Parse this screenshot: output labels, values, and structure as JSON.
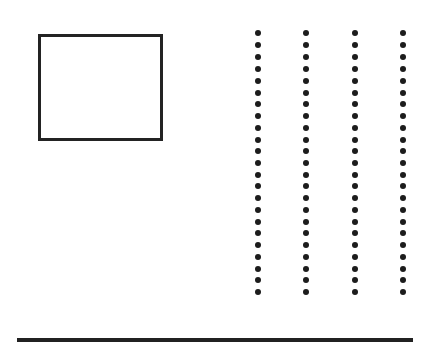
{
  "figure": {
    "title": "",
    "background_color": "#ffffff",
    "width": 430,
    "height": 356,
    "ink_color": "#232323"
  },
  "shapes": {
    "rectangle": {
      "name": "outline-rectangle",
      "label": "",
      "x": 38,
      "y": 34,
      "width": 125,
      "height": 107,
      "border_width": 3,
      "border_color": "#232323",
      "fill": "none"
    },
    "bottom_rule": {
      "name": "bottom-rule",
      "label": "",
      "x": 17,
      "y": 338,
      "width": 396,
      "height": 4,
      "color": "#212121"
    }
  },
  "chart_data": {
    "type": "scatter",
    "title": "",
    "subtitle": "",
    "xlabel": "",
    "ylabel": "",
    "grid": false,
    "legend_position": "none",
    "xlim": [
      0,
      430
    ],
    "ylim": [
      0,
      356
    ],
    "tick_labels_x": [],
    "tick_labels_y": [],
    "annotations": [],
    "marker": {
      "shape": "circle",
      "diameter_px": 6,
      "color": "#1c1c1c"
    },
    "dot_columns_count": 4,
    "dots_per_column": 23,
    "column_x": [
      258,
      306,
      355,
      403
    ],
    "row_y": [
      33,
      45,
      57,
      69,
      81,
      93,
      104,
      116,
      128,
      140,
      151,
      163,
      175,
      186,
      198,
      210,
      222,
      233,
      245,
      257,
      269,
      280,
      292
    ],
    "series": [
      {
        "name": "column-1",
        "x": [
          258,
          258,
          258,
          258,
          258,
          258,
          258,
          258,
          258,
          258,
          258,
          258,
          258,
          258,
          258,
          258,
          258,
          258,
          258,
          258,
          258,
          258,
          258
        ],
        "y": [
          33,
          45,
          57,
          69,
          81,
          93,
          104,
          116,
          128,
          140,
          151,
          163,
          175,
          186,
          198,
          210,
          222,
          233,
          245,
          257,
          269,
          280,
          292
        ]
      },
      {
        "name": "column-2",
        "x": [
          306,
          306,
          306,
          306,
          306,
          306,
          306,
          306,
          306,
          306,
          306,
          306,
          306,
          306,
          306,
          306,
          306,
          306,
          306,
          306,
          306,
          306,
          306
        ],
        "y": [
          33,
          45,
          57,
          69,
          81,
          93,
          104,
          116,
          128,
          140,
          151,
          163,
          175,
          186,
          198,
          210,
          222,
          233,
          245,
          257,
          269,
          280,
          292
        ]
      },
      {
        "name": "column-3",
        "x": [
          355,
          355,
          355,
          355,
          355,
          355,
          355,
          355,
          355,
          355,
          355,
          355,
          355,
          355,
          355,
          355,
          355,
          355,
          355,
          355,
          355,
          355,
          355
        ],
        "y": [
          33,
          45,
          57,
          69,
          81,
          93,
          104,
          116,
          128,
          140,
          151,
          163,
          175,
          186,
          198,
          210,
          222,
          233,
          245,
          257,
          269,
          280,
          292
        ]
      },
      {
        "name": "column-4",
        "x": [
          403,
          403,
          403,
          403,
          403,
          403,
          403,
          403,
          403,
          403,
          403,
          403,
          403,
          403,
          403,
          403,
          403,
          403,
          403,
          403,
          403,
          403,
          403
        ],
        "y": [
          33,
          45,
          57,
          69,
          81,
          93,
          104,
          116,
          128,
          140,
          151,
          163,
          175,
          186,
          198,
          210,
          222,
          233,
          245,
          257,
          269,
          280,
          292
        ]
      }
    ]
  }
}
